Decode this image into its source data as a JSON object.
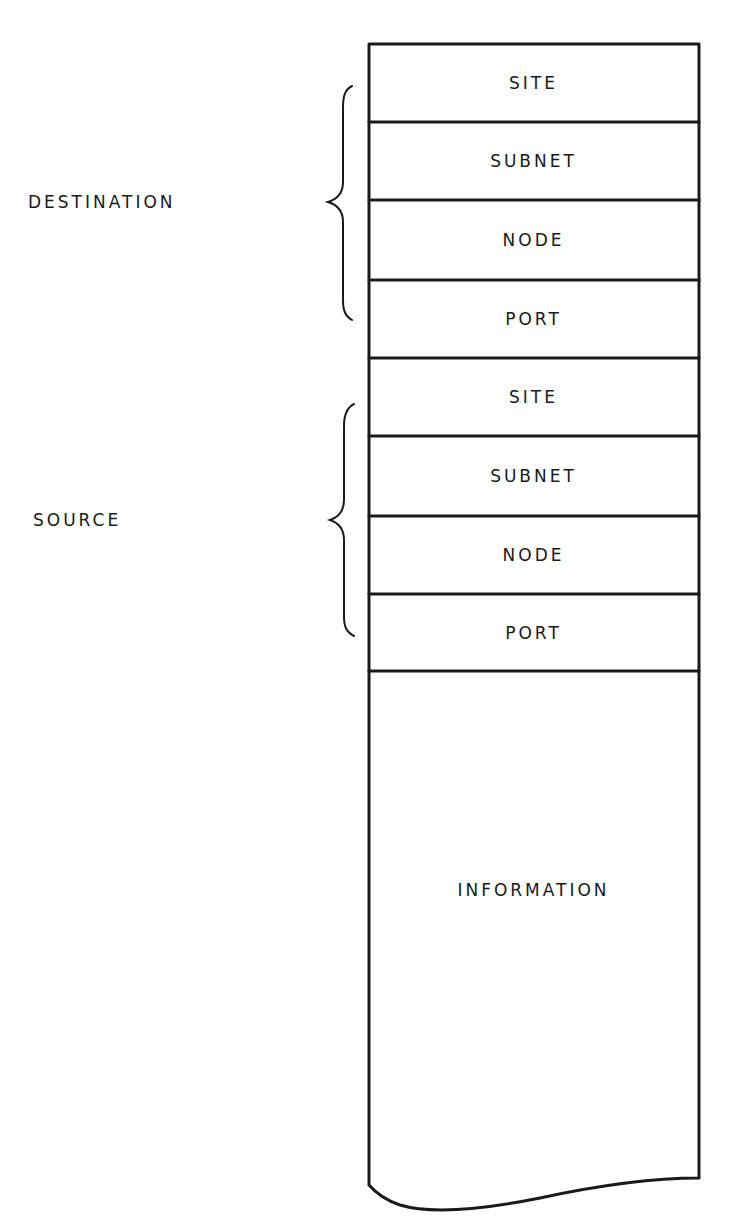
{
  "diagram": {
    "type": "packet-format",
    "groups": [
      {
        "label": "DESTINATION",
        "fields": [
          "SITE",
          "SUBNET",
          "NODE",
          "PORT"
        ]
      },
      {
        "label": "SOURCE",
        "fields": [
          "SITE",
          "SUBNET",
          "NODE",
          "PORT"
        ]
      }
    ],
    "fields": [
      {
        "label": "SITE"
      },
      {
        "label": "SUBNET"
      },
      {
        "label": "NODE"
      },
      {
        "label": "PORT"
      },
      {
        "label": "SITE"
      },
      {
        "label": "SUBNET"
      },
      {
        "label": "NODE"
      },
      {
        "label": "PORT"
      },
      {
        "label": "INFORMATION"
      }
    ],
    "labels": {
      "destination": "DESTINATION",
      "source": "SOURCE"
    },
    "colors": {
      "line": "#1a1a1a",
      "background": "#ffffff"
    }
  }
}
